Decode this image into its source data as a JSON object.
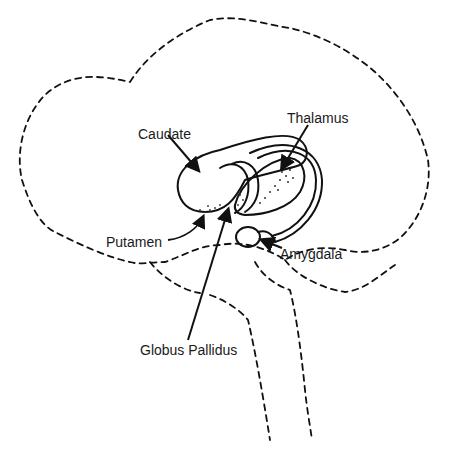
{
  "figure": {
    "type": "anatomical-diagram",
    "labels": [
      {
        "id": "caudate",
        "text": "Caudate",
        "x": 138,
        "y": 126
      },
      {
        "id": "thalamus",
        "text": "Thalamus",
        "x": 287,
        "y": 110
      },
      {
        "id": "putamen",
        "text": "Putamen",
        "x": 106,
        "y": 234
      },
      {
        "id": "amygdala",
        "text": "Amygdala",
        "x": 280,
        "y": 246
      },
      {
        "id": "globus-pallidus",
        "text": "Globus Pallidus",
        "x": 140,
        "y": 342
      }
    ],
    "colors": {
      "line": "#111111",
      "background": "#ffffff",
      "text": "#1a1a1a"
    }
  }
}
